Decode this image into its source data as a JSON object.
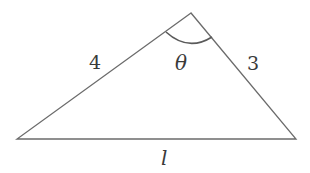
{
  "diagram": {
    "type": "triangle",
    "stroke_color": "#6b6b6b",
    "arc_color": "#5a5a5a",
    "label_color": "#3a3a3a",
    "vertices": {
      "apex": [
        191,
        13
      ],
      "left": [
        17,
        139
      ],
      "right": [
        296,
        139
      ]
    },
    "sides": {
      "left_side": {
        "label": "4"
      },
      "right_side": {
        "label": "3"
      },
      "base": {
        "label": "l"
      }
    },
    "angle": {
      "vertex": "apex",
      "label": "θ"
    }
  }
}
